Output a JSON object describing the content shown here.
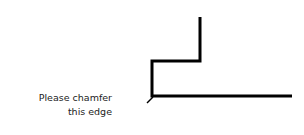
{
  "annotation": {
    "line1": "Please chamfer",
    "line2": "this edge"
  },
  "drawing": {
    "stroke_color": "#000000",
    "stroke_width": 3,
    "profile_points": [
      [
        200,
        17
      ],
      [
        200,
        61
      ],
      [
        152,
        61
      ],
      [
        152,
        96
      ],
      [
        292,
        96
      ]
    ],
    "leader": [
      [
        147,
        103
      ],
      [
        153,
        97
      ]
    ]
  }
}
